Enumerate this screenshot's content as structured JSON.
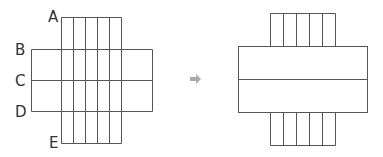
{
  "left_diagram": {
    "labels": {
      "a": "A",
      "b": "B",
      "c": "C",
      "d": "D",
      "e": "E"
    },
    "vertical_strips": 5
  },
  "arrow": {
    "icon": "right-arrow-icon",
    "color": "#aaaaaa"
  },
  "right_diagram": {
    "vertical_strips": 5
  },
  "colors": {
    "line": "#555555",
    "background": "#ffffff"
  }
}
